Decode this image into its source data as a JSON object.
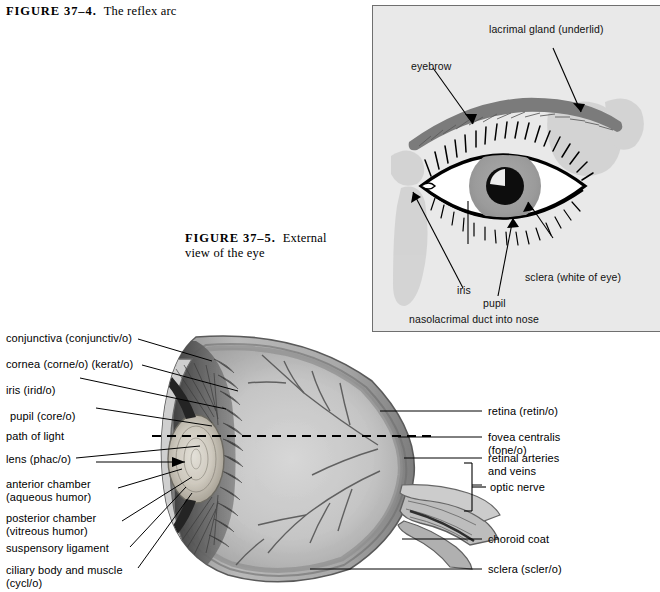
{
  "page": {
    "background_color": "#ffffff",
    "text_color": "#000000"
  },
  "figures": [
    {
      "id": "figure-37-4",
      "label": "FIGURE 37–4.",
      "text": "The reflex arc"
    },
    {
      "id": "figure-37-5",
      "label": "FIGURE 37–5.",
      "text": "External view of the eye"
    }
  ],
  "external_eye_panel": {
    "background_color": "#e9e9e9",
    "border_color": "#6f6f6f",
    "illustration": "external view of a human eye with eyebrow, eyelashes, iris, pupil and sclera",
    "labels": [
      {
        "name": "lacrimal-gland",
        "text": "lacrimal gland (underlid)"
      },
      {
        "name": "eyebrow",
        "text": "eyebrow"
      },
      {
        "name": "pupil",
        "text": "pupil"
      },
      {
        "name": "sclera",
        "text": "sclera (white of eye)"
      },
      {
        "name": "iris",
        "text": "iris"
      },
      {
        "name": "nasolacrimal-duct",
        "text": "nasolacrimal duct into nose"
      }
    ]
  },
  "eye_section": {
    "illustration": "grayscale sagittal cross-section of the human eyeball",
    "left_labels": [
      {
        "name": "conjunctiva",
        "text": "conjunctiva   (conjunctiv/o)"
      },
      {
        "name": "cornea",
        "text": "cornea   (corne/o)   (kerat/o)"
      },
      {
        "name": "iris",
        "text": "iris   (irid/o)"
      },
      {
        "name": "pupil",
        "text": "pupil   (core/o)"
      },
      {
        "name": "path-of-light",
        "text": "path of light"
      },
      {
        "name": "lens",
        "text": "lens   (phac/o)"
      },
      {
        "name": "anterior-chamber",
        "line1": "anterior chamber",
        "line2": "(aqueous humor)"
      },
      {
        "name": "posterior-chamber",
        "line1": "posterior chamber",
        "line2": "(vitreous humor)"
      },
      {
        "name": "suspensory-ligament",
        "text": "suspensory ligament"
      },
      {
        "name": "ciliary-body",
        "line1": "ciliary body and muscle",
        "line2": "(cycl/o)"
      }
    ],
    "right_labels": [
      {
        "name": "retina",
        "text": "retina   (retin/o)"
      },
      {
        "name": "fovea-centralis",
        "line1": "fovea centralis",
        "line2": "(fone/o)"
      },
      {
        "name": "retinal-arteries-and-veins",
        "line1": "retinal arteries",
        "line2": "and veins"
      },
      {
        "name": "optic-nerve",
        "text": "optic nerve"
      },
      {
        "name": "choroid-coat",
        "text": "choroid coat"
      },
      {
        "name": "sclera",
        "text": "sclera   (scler/o)"
      }
    ]
  }
}
